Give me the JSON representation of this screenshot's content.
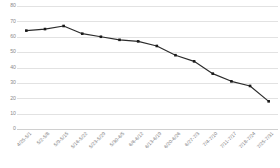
{
  "chart_data": {
    "type": "line",
    "title": "",
    "subtitle": "",
    "xlabel": "",
    "ylabel": "",
    "ylim": [
      0,
      80
    ],
    "yticks": [
      0,
      10,
      20,
      30,
      40,
      50,
      60,
      70,
      80
    ],
    "ytick_labels": [
      "0",
      "10",
      "20",
      "30",
      "40",
      "50",
      "60",
      "70",
      "80"
    ],
    "grid": true,
    "legend": false,
    "legend_position": "none",
    "marker": "square",
    "line_color": "#2b2b2b",
    "marker_color": "#1a1a1a",
    "grid_color": "#e2e2e2",
    "tick_label_color": "#8a8a8a",
    "categories": [
      "4/25-5/1",
      "5/2-5/8",
      "5/9-5/15",
      "5/16-5/22",
      "5/23-5/29",
      "5/30-6/5",
      "6/6-6/12",
      "6/13-6/19",
      "6/20-6/26",
      "6/27-7/3",
      "7/4-7/10",
      "7/11-7/17",
      "7/18-7/24",
      "7/25-7/31"
    ],
    "values": [
      64,
      65,
      67,
      62,
      60,
      58,
      57,
      54,
      48,
      44,
      36,
      31,
      28,
      18
    ]
  }
}
